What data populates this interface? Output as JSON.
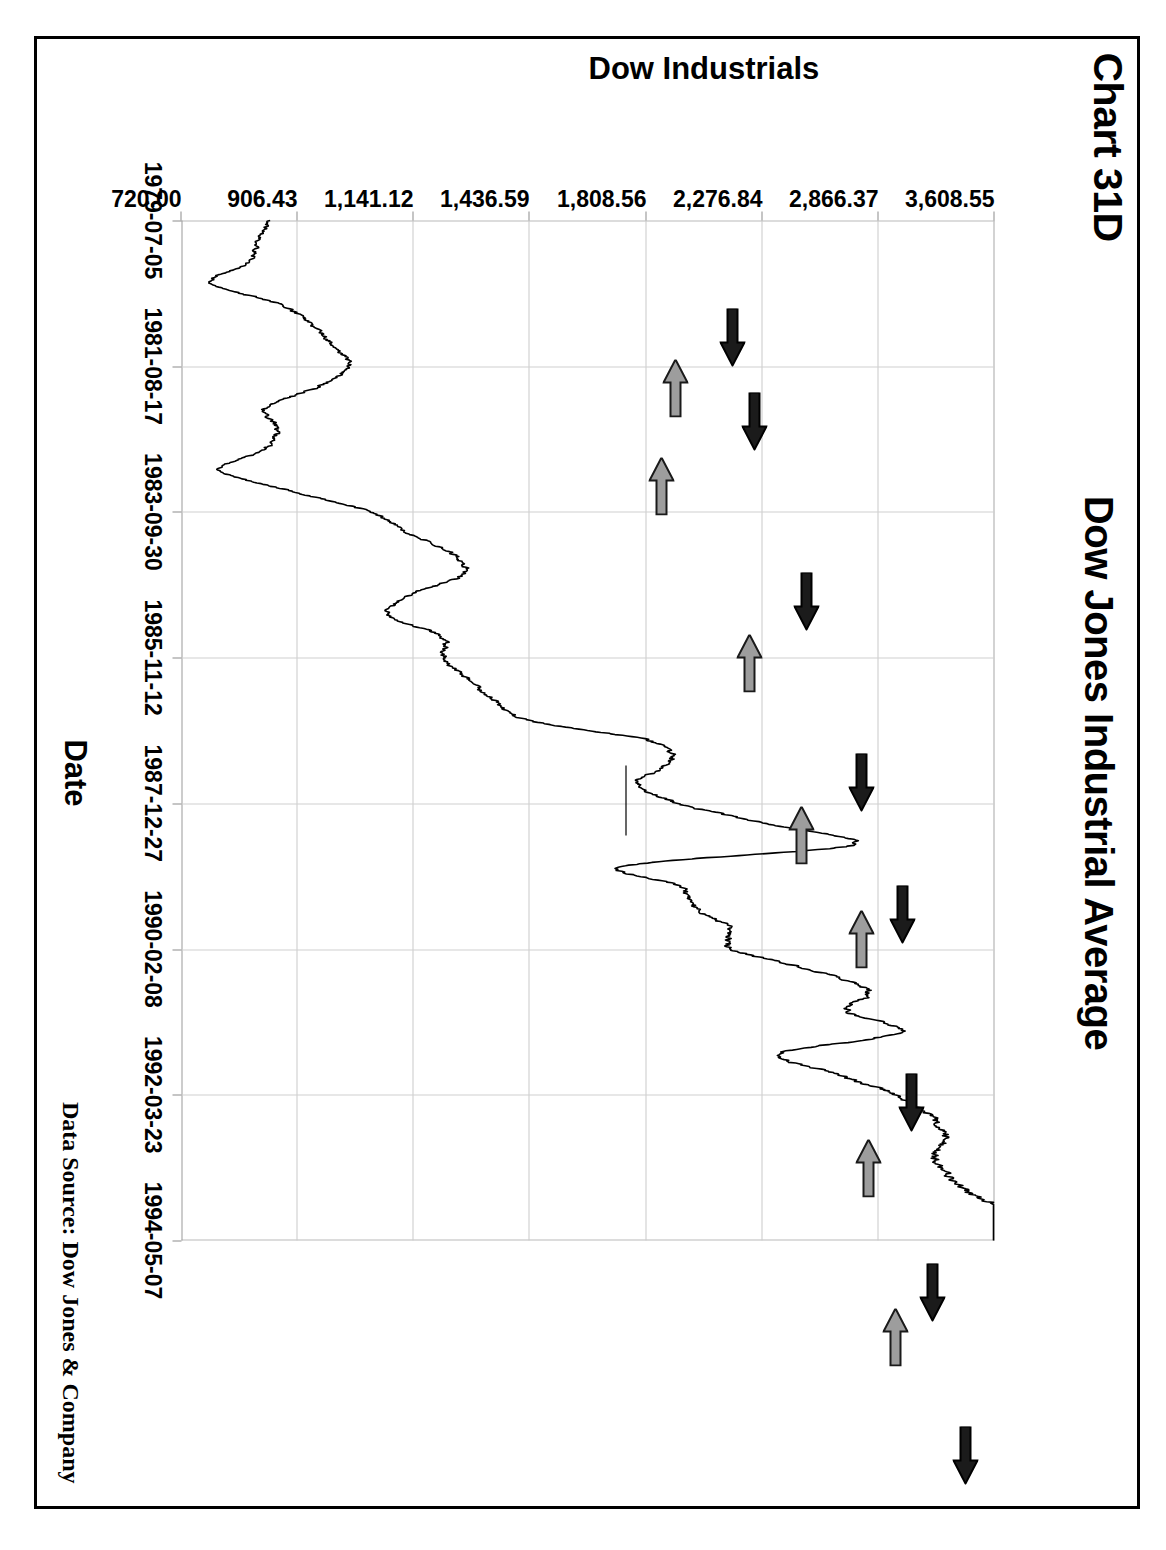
{
  "page": {
    "chart_number": "Chart 31D",
    "data_source": "Data Source:  Dow Jones & Company"
  },
  "chart_data": {
    "type": "line",
    "title": "Dow Jones Industrial Average",
    "xlabel": "Date",
    "ylabel": "Dow Industrials",
    "yscale": "log",
    "grid": true,
    "legend": "none",
    "ylim": [
      720.0,
      3608.55
    ],
    "ytick_labels": [
      "3,608.55",
      "2,866.37",
      "2,276.84",
      "1,808.56",
      "1,436.59",
      "1,141.12",
      "906.43",
      "720.00"
    ],
    "ytick_values": [
      3608.55,
      2866.37,
      2276.84,
      1808.56,
      1436.59,
      1141.12,
      906.43,
      720.0
    ],
    "xtick_labels": [
      "1979-07-05",
      "1981-08-17",
      "1983-09-30",
      "1985-11-12",
      "1987-12-27",
      "1990-02-08",
      "1992-03-23",
      "1994-05-07"
    ],
    "series": [
      {
        "name": "Dow Industrials",
        "x": [
          "1979-07-05",
          "1979-10-01",
          "1980-01-02",
          "1980-04-01",
          "1980-07-01",
          "1980-10-01",
          "1981-01-02",
          "1981-04-01",
          "1981-08-17",
          "1981-10-01",
          "1982-01-04",
          "1982-04-01",
          "1982-08-12",
          "1982-10-01",
          "1983-01-03",
          "1983-04-01",
          "1983-09-30",
          "1984-01-03",
          "1984-04-02",
          "1984-07-24",
          "1984-10-01",
          "1985-01-02",
          "1985-04-01",
          "1985-07-01",
          "1985-11-12",
          "1986-04-01",
          "1986-07-01",
          "1986-10-01",
          "1987-01-02",
          "1987-04-01",
          "1987-08-25",
          "1987-10-19",
          "1987-12-27",
          "1988-04-01",
          "1988-10-03",
          "1989-01-03",
          "1989-07-03",
          "1990-01-02",
          "1990-02-08",
          "1990-07-16",
          "1990-10-11",
          "1991-01-02",
          "1991-07-01",
          "1992-01-02",
          "1992-03-23",
          "1992-10-01",
          "1993-01-04",
          "1993-07-01",
          "1994-01-31",
          "1994-05-07"
        ],
        "values": [
          855,
          838,
          824,
          763,
          872,
          932,
          972,
          1004,
          943,
          849,
          871,
          848,
          777,
          896,
          1046,
          1130,
          1233,
          1259,
          1130,
          1087,
          1207,
          1212,
          1267,
          1335,
          1430,
          1822,
          1903,
          1774,
          1927,
          2305,
          2722,
          1738,
          1938,
          1990,
          2135,
          2144,
          2510,
          2810,
          2700,
          2999,
          2365,
          2634,
          2966,
          3172,
          3280,
          3200,
          3310,
          3510,
          3978,
          3607
        ]
      }
    ],
    "annotations": {
      "peak_arrows": {
        "style": "black-arrow-pointing-right",
        "label": "cycle peak marker",
        "count": 8
      },
      "trough_arrows": {
        "style": "gray-arrow-pointing-left",
        "label": "cycle trough marker",
        "count": 7
      }
    }
  },
  "arrows": [
    {
      "name": "peak-1979",
      "kind": "peak",
      "x": 88,
      "y": 249
    },
    {
      "name": "trough-1980",
      "kind": "trough",
      "x": 139,
      "y": 306
    },
    {
      "name": "peak-1981",
      "kind": "peak",
      "x": 172,
      "y": 227
    },
    {
      "name": "trough-1982",
      "kind": "trough",
      "x": 237,
      "y": 320
    },
    {
      "name": "peak-1983",
      "kind": "peak",
      "x": 352,
      "y": 175
    },
    {
      "name": "trough-1984",
      "kind": "trough",
      "x": 414,
      "y": 232
    },
    {
      "name": "peak-1985",
      "kind": "peak",
      "x": 533,
      "y": 120
    },
    {
      "name": "trough-1986",
      "kind": "trough",
      "x": 586,
      "y": 180
    },
    {
      "name": "peak-1987",
      "kind": "peak",
      "x": 665,
      "y": 79
    },
    {
      "name": "trough-1987",
      "kind": "trough",
      "x": 690,
      "y": 120
    },
    {
      "name": "peak-1990",
      "kind": "peak",
      "x": 853,
      "y": 70
    },
    {
      "name": "trough-1990",
      "kind": "trough",
      "x": 919,
      "y": 113
    },
    {
      "name": "peak-1992",
      "kind": "peak",
      "x": 1043,
      "y": 49
    },
    {
      "name": "trough-1992",
      "kind": "trough",
      "x": 1088,
      "y": 86
    },
    {
      "name": "peak-1994",
      "kind": "peak",
      "x": 1206,
      "y": 16
    }
  ]
}
